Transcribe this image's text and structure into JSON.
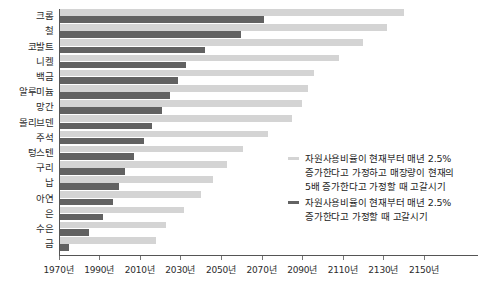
{
  "chart_data": {
    "type": "bar",
    "orientation": "horizontal",
    "title": "",
    "xlabel": "",
    "ylabel": "",
    "xlim": [
      1970,
      2160
    ],
    "grid": false,
    "legend_position": "right-middle",
    "categories": [
      "크롬",
      "철",
      "코발트",
      "니켈",
      "백금",
      "알루미늄",
      "망간",
      "몰리브덴",
      "주석",
      "텅스텐",
      "구리",
      "납",
      "아연",
      "은",
      "수은",
      "금"
    ],
    "series": [
      {
        "name": "자원사용비율이 현재부터 매년 2.5%\n증가한다고 가정하고 매장량이 현재의\n5배 증가한다고 가정할 때 고갈시기",
        "key": "five_times_reserves",
        "color": "#d4d4d4",
        "values": [
          2140,
          2132,
          2120,
          2108,
          2096,
          2093,
          2090,
          2085,
          2073,
          2061,
          2053,
          2046,
          2040,
          2032,
          2023,
          2018
        ]
      },
      {
        "name": "자원사용비율이 현재부터 매년 2.5%\n증가한다고 가정할 때 고갈시기",
        "key": "current_reserves",
        "color": "#626262",
        "values": [
          2071,
          2060,
          2042,
          2033,
          2029,
          2025,
          2021,
          2016,
          2012,
          2007,
          2003,
          2000,
          1997,
          1992,
          1985,
          1975
        ]
      }
    ],
    "xticks": [
      1970,
      1990,
      2010,
      2030,
      2050,
      2070,
      2090,
      2110,
      2130,
      2150
    ],
    "xtick_labels": [
      "1970년",
      "1990년",
      "2010년",
      "2030년",
      "2050년",
      "2070년",
      "2090년",
      "2110년",
      "2130년",
      "2150년"
    ]
  },
  "legend": {
    "entries": [
      {
        "marker": "light-dash-marker",
        "label": "자원사용비율이 현재부터 매년 2.5%\n증가한다고 가정하고 매장량이 현재의\n5배 증가한다고 가정할 때 고갈시기"
      },
      {
        "marker": "dark-dash-marker",
        "label": "자원사용비율이 현재부터 매년 2.5%\n증가한다고 가정할 때 고갈시기"
      }
    ]
  },
  "colors": {
    "light_bar": "#d4d4d4",
    "dark_bar": "#626262",
    "axis": "#555555",
    "text": "#2b2b2b",
    "background": "#ffffff"
  },
  "caption": {
    "text": ""
  }
}
